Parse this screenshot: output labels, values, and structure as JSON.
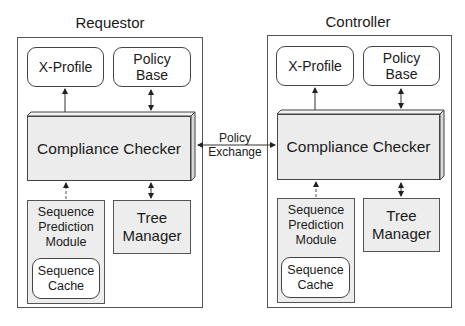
{
  "diagram": {
    "panels": [
      {
        "title": "Requestor",
        "x_profile": "X-Profile",
        "policy_base": "Policy\nBase",
        "compliance_checker": "Compliance Checker",
        "sequence_prediction_module": "Sequence\nPrediction\nModule",
        "sequence_cache": "Sequence\nCache",
        "tree_manager": "Tree\nManager"
      },
      {
        "title": "Controller",
        "x_profile": "X-Profile",
        "policy_base": "Policy\nBase",
        "compliance_checker": "Compliance Checker",
        "sequence_prediction_module": "Sequence\nPrediction\nModule",
        "sequence_cache": "Sequence\nCache",
        "tree_manager": "Tree\nManager"
      }
    ],
    "exchange_label": "Policy\nExchange",
    "edges": [
      {
        "from": "Compliance Checker",
        "to": "X-Profile",
        "style": "solid",
        "direction": "one-way"
      },
      {
        "from": "Compliance Checker",
        "to": "Policy Base",
        "style": "solid",
        "direction": "two-way"
      },
      {
        "from": "Compliance Checker",
        "to": "Tree Manager",
        "style": "solid",
        "direction": "two-way"
      },
      {
        "from": "Sequence Prediction Module",
        "to": "Compliance Checker",
        "style": "dashed",
        "direction": "one-way"
      },
      {
        "from": "Requestor Compliance Checker",
        "to": "Controller Compliance Checker",
        "style": "solid",
        "direction": "two-way",
        "label": "Policy Exchange"
      }
    ],
    "colors": {
      "box_fill": "#ededed",
      "border": "#444444",
      "background": "#ffffff"
    }
  }
}
